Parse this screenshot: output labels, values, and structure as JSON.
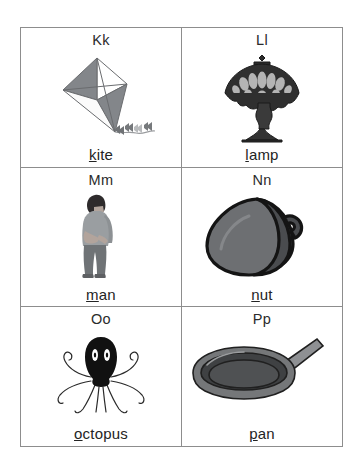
{
  "worksheet": {
    "title": "Alphabet picture cards K-P",
    "border_color": "#8d8d8d",
    "text_color": "#242424",
    "shaded_cell_color": "#d5d5d5",
    "page_background": "#ffffff"
  },
  "cells": [
    {
      "heading": "Kk",
      "word_initial": "k",
      "word_rest": "ite",
      "word": "kite",
      "icon": "kite-icon",
      "shaded": false,
      "colors": {
        "panel_dark": "#7f8184",
        "panel_light": "#ffffff",
        "line": "#6a6c6f",
        "tail": "#8a8c8f"
      }
    },
    {
      "heading": "Ll",
      "word_initial": "l",
      "word_rest": "amp",
      "word": "lamp",
      "icon": "lamp-icon",
      "shaded": false,
      "colors": {
        "body": "#2b2b2b",
        "shade_panel": "#b9b9b9",
        "outline": "#1a1a1a"
      }
    },
    {
      "heading": "Mm",
      "word_initial": "m",
      "word_rest": "an",
      "word": "man",
      "icon": "man-icon",
      "shaded": false,
      "colors": {
        "hair": "#2e2b2c",
        "skin": "#b2a49c",
        "shirt": "#9a9ea1",
        "pants": "#6f7376",
        "shoes": "#5e6063"
      }
    },
    {
      "heading": "Nn",
      "word_initial": "n",
      "word_rest": "ut",
      "word": "nut",
      "icon": "nut-icon",
      "shaded": false,
      "colors": {
        "body": "#6d6f72",
        "cap": "#4a4c4f",
        "outline": "#141414"
      }
    },
    {
      "heading": "Oo",
      "word_initial": "o",
      "word_rest": "ctopus",
      "word": "octopus",
      "icon": "octopus-icon",
      "shaded": true,
      "colors": {
        "body": "#111111",
        "eye": "#ffffff",
        "tentacle": "#2a2a2a"
      }
    },
    {
      "heading": "Pp",
      "word_initial": "p",
      "word_rest": "an",
      "word": "pan",
      "icon": "pan-icon",
      "shaded": false,
      "colors": {
        "rim": "#757779",
        "inner": "#4f5153",
        "handle": "#8e9093",
        "outline": "#202020"
      }
    }
  ]
}
